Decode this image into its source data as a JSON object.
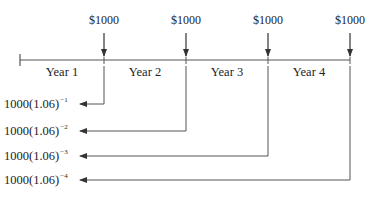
{
  "diagram": {
    "type": "cash-flow-timeline",
    "cash_flows": [
      {
        "label": "$1000",
        "x": 104
      },
      {
        "label": "$1000",
        "x": 186
      },
      {
        "label": "$1000",
        "x": 268
      },
      {
        "label": "$1000",
        "x": 350
      }
    ],
    "periods": [
      {
        "label": "Year 1",
        "x": 62
      },
      {
        "label": "Year 2",
        "x": 145
      },
      {
        "label": "Year 3",
        "x": 227
      },
      {
        "label": "Year 4",
        "x": 309
      }
    ],
    "present_values": [
      {
        "base": "1000(1.06)",
        "exponent": "−1",
        "y": 105
      },
      {
        "base": "1000(1.06)",
        "exponent": "−2",
        "y": 132
      },
      {
        "base": "1000(1.06)",
        "exponent": "−3",
        "y": 158
      },
      {
        "base": "1000(1.06)",
        "exponent": "−4",
        "y": 181
      }
    ],
    "line_color": "#444444"
  }
}
